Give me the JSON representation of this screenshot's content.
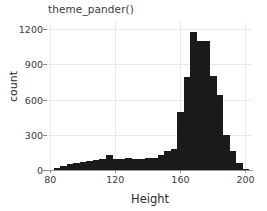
{
  "chart_data": {
    "type": "bar",
    "title": "theme_pander()",
    "xlabel": "Height",
    "ylabel": "count",
    "xlim": [
      78,
      204
    ],
    "ylim": [
      0,
      1260
    ],
    "xticks": [
      80,
      120,
      160,
      200
    ],
    "yticks": [
      0,
      300,
      600,
      900,
      1200
    ],
    "grid": true,
    "legend": null,
    "bin_width": 4,
    "bin_starts": [
      82,
      86,
      90,
      94,
      98,
      102,
      106,
      110,
      114,
      118,
      122,
      126,
      130,
      134,
      138,
      142,
      146,
      150,
      154,
      158,
      162,
      166,
      170,
      174,
      178,
      182,
      186,
      190,
      194,
      198
    ],
    "categories": [
      "82-86",
      "86-90",
      "90-94",
      "94-98",
      "98-102",
      "102-106",
      "106-110",
      "110-114",
      "114-118",
      "118-122",
      "122-126",
      "126-130",
      "130-134",
      "134-138",
      "138-142",
      "142-146",
      "146-150",
      "150-154",
      "154-158",
      "158-162",
      "162-166",
      "166-170",
      "170-174",
      "174-178",
      "178-182",
      "182-186",
      "186-190",
      "190-194",
      "194-198",
      "198-202"
    ],
    "values": [
      20,
      35,
      50,
      60,
      70,
      80,
      85,
      95,
      130,
      90,
      95,
      100,
      95,
      95,
      100,
      105,
      130,
      160,
      175,
      490,
      790,
      1175,
      1095,
      1095,
      800,
      640,
      300,
      165,
      60,
      10
    ]
  },
  "colors": {
    "bar": "#1a1a1a",
    "grid": "#e9e9ea",
    "axis": "#9a9a9a",
    "text": "#2b2b2b",
    "background": "#ffffff"
  }
}
